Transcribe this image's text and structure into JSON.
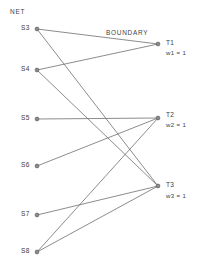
{
  "diagram": {
    "headers": {
      "net": "NET",
      "boundary": "BOUNDARY"
    },
    "source_nodes": [
      {
        "id": "S3",
        "label": "S3",
        "x": 37,
        "y": 29,
        "label_x": 21,
        "label_y": 25
      },
      {
        "id": "S4",
        "label": "S4",
        "x": 37,
        "y": 70,
        "label_x": 21,
        "label_y": 66
      },
      {
        "id": "S5",
        "label": "S5",
        "x": 37,
        "y": 119,
        "label_x": 21,
        "label_y": 115
      },
      {
        "id": "S6",
        "label": "S6",
        "x": 37,
        "y": 166,
        "label_x": 21,
        "label_y": 162
      },
      {
        "id": "S7",
        "label": "S7",
        "x": 37,
        "y": 215,
        "label_x": 21,
        "label_y": 211
      },
      {
        "id": "S8",
        "label": "S8",
        "x": 37,
        "y": 252,
        "label_x": 21,
        "label_y": 248
      }
    ],
    "target_nodes": [
      {
        "id": "T1",
        "label": "T1",
        "weight_label": "w1 = 1",
        "x": 158,
        "y": 44,
        "label_x": 166,
        "label_y": 40,
        "weight_x": 166,
        "weight_y": 50
      },
      {
        "id": "T2",
        "label": "T2",
        "weight_label": "w2 = 1",
        "x": 158,
        "y": 118,
        "label_x": 166,
        "label_y": 112,
        "weight_x": 166,
        "weight_y": 122
      },
      {
        "id": "T3",
        "label": "T3",
        "weight_label": "w3 = 1",
        "x": 158,
        "y": 186,
        "label_x": 166,
        "label_y": 182,
        "weight_x": 166,
        "weight_y": 193
      }
    ],
    "edges": [
      {
        "from": "S3",
        "to": "T1",
        "x1": 37,
        "y1": 29,
        "x2": 158,
        "y2": 44
      },
      {
        "from": "S3",
        "to": "T3",
        "x1": 37,
        "y1": 29,
        "x2": 158,
        "y2": 186
      },
      {
        "from": "S4",
        "to": "T1",
        "x1": 37,
        "y1": 70,
        "x2": 158,
        "y2": 44
      },
      {
        "from": "S4",
        "to": "T3",
        "x1": 37,
        "y1": 70,
        "x2": 158,
        "y2": 186
      },
      {
        "from": "S5",
        "to": "T2",
        "x1": 37,
        "y1": 119,
        "x2": 158,
        "y2": 118
      },
      {
        "from": "S6",
        "to": "T2",
        "x1": 37,
        "y1": 166,
        "x2": 158,
        "y2": 118
      },
      {
        "from": "S7",
        "to": "T3",
        "x1": 37,
        "y1": 215,
        "x2": 158,
        "y2": 186
      },
      {
        "from": "S8",
        "to": "T2",
        "x1": 37,
        "y1": 252,
        "x2": 158,
        "y2": 118
      },
      {
        "from": "S8",
        "to": "T3",
        "x1": 37,
        "y1": 252,
        "x2": 158,
        "y2": 186
      }
    ],
    "header_positions": {
      "net_x": 10,
      "net_y": 9,
      "boundary_x": 106,
      "boundary_y": 30
    },
    "colors": {
      "line": "#6e6e6e",
      "node_stroke": "#5a5a5a",
      "node_fill": "#8c8c8c",
      "text": "#3b3b3b",
      "background": "#ffffff"
    }
  }
}
